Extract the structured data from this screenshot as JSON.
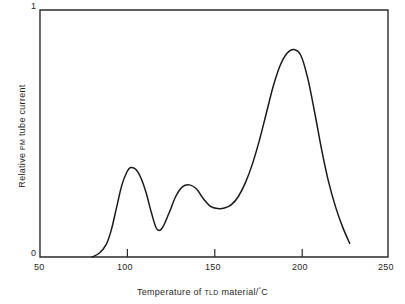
{
  "chart_data": {
    "type": "line",
    "title": "",
    "xlabel": "Temperature of TLD material/°C",
    "ylabel": "Relative PM tube current",
    "xlim": [
      50,
      250
    ],
    "ylim": [
      0,
      1
    ],
    "grid": false,
    "legend": "none",
    "xticks": [
      50,
      100,
      150,
      200,
      250
    ],
    "xtick_labels": [
      "50",
      "100",
      "150",
      "200",
      "250"
    ],
    "yticks": [
      0,
      1
    ],
    "ytick_labels": [
      "0",
      "1"
    ],
    "series": [
      {
        "name": "TLD glow curve",
        "x": [
          80,
          84,
          88,
          91,
          94,
          97,
          100,
          102,
          105,
          108,
          111,
          114,
          117,
          120,
          124,
          128,
          132,
          136,
          140,
          144,
          148,
          152,
          156,
          160,
          164,
          168,
          172,
          176,
          180,
          184,
          188,
          192,
          196,
          200,
          204,
          208,
          212,
          216,
          220,
          224,
          228
        ],
        "y": [
          0.0,
          0.015,
          0.05,
          0.11,
          0.2,
          0.29,
          0.345,
          0.362,
          0.355,
          0.32,
          0.26,
          0.18,
          0.115,
          0.115,
          0.175,
          0.245,
          0.285,
          0.292,
          0.275,
          0.235,
          0.205,
          0.196,
          0.198,
          0.212,
          0.245,
          0.3,
          0.375,
          0.47,
          0.58,
          0.69,
          0.775,
          0.825,
          0.84,
          0.815,
          0.72,
          0.58,
          0.43,
          0.3,
          0.2,
          0.12,
          0.055
        ]
      }
    ],
    "annotations": {
      "peak_1_temperature": 102,
      "peak_1_value": 0.36,
      "valley_1_temperature": 118,
      "valley_1_value": 0.115,
      "peak_2_temperature": 136,
      "peak_2_value": 0.29,
      "shoulder_temperature": 153,
      "shoulder_value": 0.2,
      "peak_3_temperature": 196,
      "peak_3_value": 0.84,
      "curve_onset_temperature": 80,
      "curve_end_temperature": 228
    }
  },
  "axes": {
    "x_title": "Temperature of TLD material/°C",
    "x_title_parts": {
      "lead": "Temperature of",
      "smallcaps": "TLD",
      "trail": "material/",
      "degree": "°",
      "unit": "C"
    },
    "y_title": "Relative PM tube current",
    "y_title_parts": {
      "lead": "Relative",
      "smallcaps": "PM",
      "trail": "tube current"
    },
    "x_tick_labels": {
      "t50": "50",
      "t100": "100",
      "t150": "150",
      "t200": "200",
      "t250": "250"
    },
    "y_tick_labels": {
      "top": "1",
      "bottom": "0"
    }
  },
  "style": {
    "curve_color": "#1a1a1a",
    "frame_color": "#2b2b2b",
    "background": "#ffffff",
    "text_color": "#1f1f1f"
  }
}
